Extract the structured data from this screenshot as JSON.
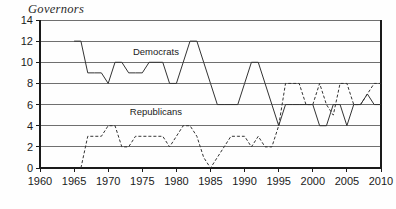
{
  "chart_data": {
    "type": "line",
    "title": "Governors",
    "xlabel": "",
    "ylabel": "",
    "xlim": [
      1960,
      2010
    ],
    "ylim": [
      0,
      14
    ],
    "grid": true,
    "legend_position": "inline-annotation",
    "xticks": [
      1960,
      1965,
      1970,
      1975,
      1980,
      1985,
      1990,
      1995,
      2000,
      2005,
      2010
    ],
    "yticks": [
      0,
      2,
      4,
      6,
      8,
      10,
      12,
      14
    ],
    "annotations": [
      {
        "text": "Democrats",
        "x": 1977,
        "y": 10.7
      },
      {
        "text": "Republicans",
        "x": 1977,
        "y": 5.0
      }
    ],
    "series": [
      {
        "name": "Democrats",
        "style": "solid",
        "color": "#333333",
        "x": [
          1965,
          1966,
          1967,
          1968,
          1969,
          1970,
          1971,
          1972,
          1973,
          1974,
          1975,
          1976,
          1977,
          1978,
          1979,
          1980,
          1981,
          1982,
          1983,
          1984,
          1985,
          1986,
          1987,
          1988,
          1989,
          1990,
          1991,
          1992,
          1993,
          1994,
          1995,
          1996,
          1997,
          1998,
          1999,
          2000,
          2001,
          2002,
          2003,
          2004,
          2005,
          2006,
          2007,
          2008,
          2009,
          2010
        ],
        "values": [
          12,
          12,
          9,
          9,
          9,
          8,
          10,
          10,
          9,
          9,
          9,
          10,
          10,
          10,
          8,
          8,
          10,
          12,
          12,
          10,
          8,
          6,
          6,
          6,
          6,
          8,
          10,
          10,
          8,
          6,
          4,
          6,
          6,
          6,
          6,
          6,
          4,
          4,
          6,
          6,
          4,
          6,
          6,
          7,
          6,
          6
        ]
      },
      {
        "name": "Republicans",
        "style": "dashed",
        "color": "#333333",
        "x": [
          1966,
          1967,
          1968,
          1969,
          1970,
          1971,
          1972,
          1973,
          1974,
          1975,
          1976,
          1977,
          1978,
          1979,
          1980,
          1981,
          1982,
          1983,
          1984,
          1985,
          1986,
          1987,
          1988,
          1989,
          1990,
          1991,
          1992,
          1993,
          1994,
          1995,
          1996,
          1997,
          1998,
          1999,
          2000,
          2001,
          2002,
          2003,
          2004,
          2005,
          2006,
          2007,
          2008,
          2009,
          2010
        ],
        "values": [
          0,
          3,
          3,
          3,
          4,
          4,
          2,
          2,
          3,
          3,
          3,
          3,
          3,
          2,
          3,
          4,
          4,
          3,
          1,
          0,
          1,
          2,
          3,
          3,
          3,
          2,
          3,
          2,
          2,
          4,
          8,
          8,
          8,
          6,
          6,
          8,
          6,
          5,
          8,
          8,
          6,
          6,
          7,
          8,
          8
        ]
      }
    ]
  }
}
